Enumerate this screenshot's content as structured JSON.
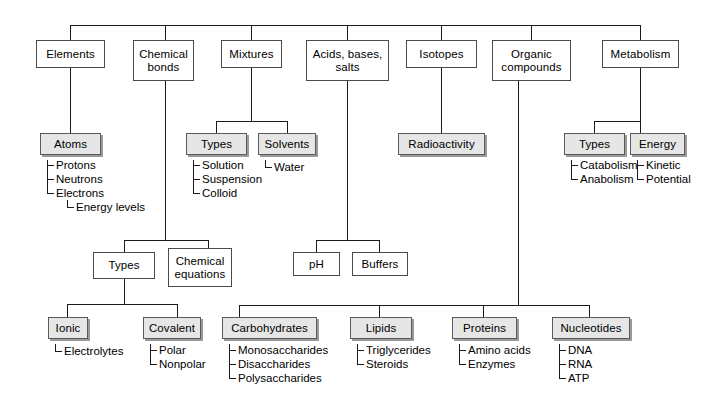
{
  "diagram": {
    "root_connector": true,
    "top_level": [
      {
        "id": "elements",
        "label": "Elements"
      },
      {
        "id": "chem-bonds",
        "label": "Chemical\nbonds"
      },
      {
        "id": "mixtures",
        "label": "Mixtures"
      },
      {
        "id": "acids",
        "label": "Acids, bases,\nsalts"
      },
      {
        "id": "isotopes",
        "label": "Isotopes"
      },
      {
        "id": "organic",
        "label": "Organic\ncompounds"
      },
      {
        "id": "metabolism",
        "label": "Metabolism"
      }
    ],
    "second_level": [
      {
        "id": "atoms",
        "label": "Atoms",
        "style": "shaded"
      },
      {
        "id": "types-mix",
        "label": "Types",
        "style": "shaded"
      },
      {
        "id": "solvents",
        "label": "Solvents",
        "style": "shaded"
      },
      {
        "id": "radioactivity",
        "label": "Radioactivity",
        "style": "shaded"
      },
      {
        "id": "types-met",
        "label": "Types",
        "style": "shaded"
      },
      {
        "id": "energy",
        "label": "Energy",
        "style": "shaded"
      },
      {
        "id": "types-bond",
        "label": "Types",
        "style": "plain"
      },
      {
        "id": "chem-eq",
        "label": "Chemical\nequations",
        "style": "plain"
      },
      {
        "id": "ph",
        "label": "pH",
        "style": "plain"
      },
      {
        "id": "buffers",
        "label": "Buffers",
        "style": "plain"
      },
      {
        "id": "ionic",
        "label": "Ionic",
        "style": "shaded"
      },
      {
        "id": "covalent",
        "label": "Covalent",
        "style": "shaded"
      },
      {
        "id": "carbohydrates",
        "label": "Carbohydrates",
        "style": "shaded"
      },
      {
        "id": "lipids",
        "label": "Lipids",
        "style": "shaded"
      },
      {
        "id": "proteins",
        "label": "Proteins",
        "style": "shaded"
      },
      {
        "id": "nucleotides",
        "label": "Nucleotides",
        "style": "shaded"
      }
    ],
    "leaves": {
      "atoms": [
        "Protons",
        "Neutrons",
        "Electrons"
      ],
      "electrons": [
        "Energy levels"
      ],
      "types_mix": [
        "Solution",
        "Suspension",
        "Colloid"
      ],
      "solvents": [
        "Water"
      ],
      "types_met": [
        "Catabolism",
        "Anabolism"
      ],
      "energy": [
        "Kinetic",
        "Potential"
      ],
      "ionic": [
        "Electrolytes"
      ],
      "covalent": [
        "Polar",
        "Nonpolar"
      ],
      "carbohydrates": [
        "Monosaccharides",
        "Disaccharides",
        "Polysaccharides"
      ],
      "lipids": [
        "Triglycerides",
        "Steroids"
      ],
      "proteins": [
        "Amino acids",
        "Enzymes"
      ],
      "nucleotides": [
        "DNA",
        "RNA",
        "ATP"
      ]
    },
    "colors": {
      "line": "#1a1a1a",
      "shaded_fill": "#e6e6e6",
      "plain_fill": "#ffffff",
      "border": "#4a4a4a",
      "shadow": "#9a9a9a",
      "text": "#000000",
      "background": "#ffffff"
    }
  }
}
